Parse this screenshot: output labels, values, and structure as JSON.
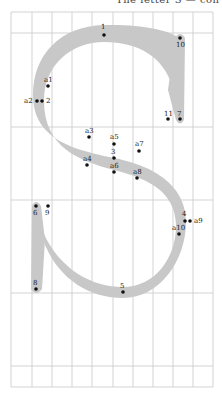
{
  "header": {
    "partial_title": "The letter S — con"
  },
  "grid": {
    "vertical_x": [
      11,
      32,
      52,
      72,
      92,
      113,
      133,
      153,
      173,
      193,
      213
    ],
    "horizontal_y": [
      12,
      33,
      127,
      200,
      293,
      366,
      387
    ],
    "line_color": "#c8c8c8"
  },
  "glyph": {
    "fill": "#c8c8c8",
    "letter": "S"
  },
  "points": [
    {
      "id": "1",
      "label": "1",
      "x": 104,
      "y": 35,
      "lx": 101,
      "ly": 29
    },
    {
      "id": "10",
      "label": "10",
      "x": 180,
      "y": 38,
      "lx": 176,
      "ly": 47
    },
    {
      "id": "a1",
      "label": "a1",
      "x": 48,
      "y": 86,
      "lx": 44,
      "ly": 82
    },
    {
      "id": "a2",
      "label": "a2",
      "x": 37,
      "y": 101,
      "lx": 24,
      "ly": 103
    },
    {
      "id": "2",
      "label": "2",
      "x": 42,
      "y": 101,
      "lx": 46,
      "ly": 103
    },
    {
      "id": "11",
      "label": "11",
      "x": 168,
      "y": 119,
      "lx": 164,
      "ly": 116
    },
    {
      "id": "7",
      "label": "7",
      "x": 180,
      "y": 119,
      "lx": 177,
      "ly": 116
    },
    {
      "id": "a3",
      "label": "a3",
      "x": 89,
      "y": 137,
      "lx": 85,
      "ly": 133
    },
    {
      "id": "a5",
      "label": "a5",
      "x": 114,
      "y": 144,
      "lx": 110,
      "ly": 139
    },
    {
      "id": "a7",
      "label": "a7",
      "x": 139,
      "y": 151,
      "lx": 135,
      "ly": 146
    },
    {
      "id": "3",
      "label": "3",
      "x": 114,
      "y": 158,
      "lx": 111,
      "ly": 154
    },
    {
      "id": "a4",
      "label": "a4",
      "x": 87,
      "y": 165,
      "lx": 83,
      "ly": 161
    },
    {
      "id": "a6",
      "label": "a6",
      "x": 114,
      "y": 172,
      "lx": 110,
      "ly": 168
    },
    {
      "id": "a8",
      "label": "a8",
      "x": 137,
      "y": 178,
      "lx": 133,
      "ly": 174
    },
    {
      "id": "6",
      "label": "6",
      "x": 36,
      "y": 206,
      "lx": 33,
      "ly": 215
    },
    {
      "id": "9",
      "label": "9",
      "x": 48,
      "y": 206,
      "lx": 45,
      "ly": 215
    },
    {
      "id": "4",
      "label": "4",
      "x": 185,
      "y": 221,
      "lx": 182,
      "ly": 216
    },
    {
      "id": "a9",
      "label": "a9",
      "x": 190,
      "y": 221,
      "lx": 194,
      "ly": 223
    },
    {
      "id": "a10",
      "label": "a10",
      "x": 179,
      "y": 234,
      "lx": 172,
      "ly": 230
    },
    {
      "id": "8",
      "label": "8",
      "x": 36,
      "y": 289,
      "lx": 33,
      "ly": 285
    },
    {
      "id": "5",
      "label": "5",
      "x": 123,
      "y": 292,
      "lx": 120,
      "ly": 288
    }
  ]
}
